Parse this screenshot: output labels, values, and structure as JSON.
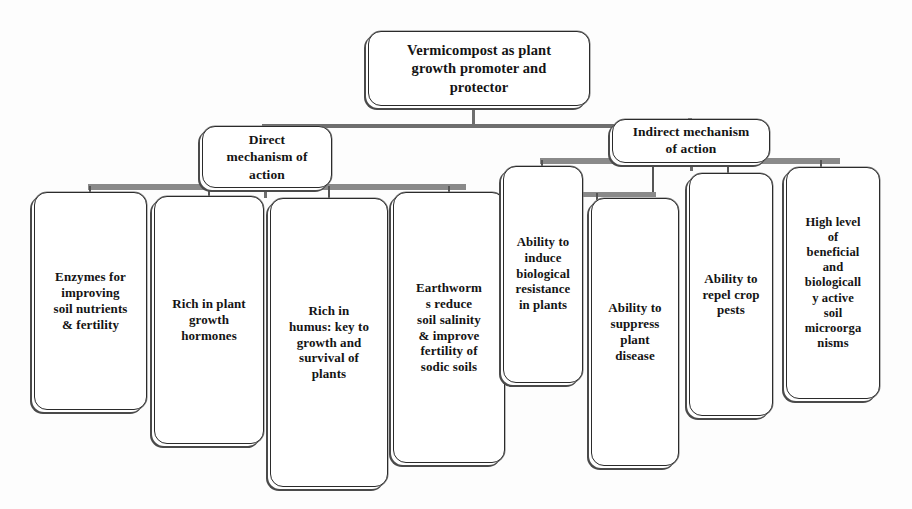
{
  "diagram": {
    "title_node": {
      "id": "root",
      "label": "Vermicompost as plant\ngrowth promoter and\nprotector"
    },
    "branches": [
      {
        "id": "direct",
        "label": "Direct\nmechanism of\naction",
        "leaves": [
          {
            "id": "l1",
            "label": "Enzymes for\nimproving\nsoil nutrients\n& fertility"
          },
          {
            "id": "l2",
            "label": "Rich in plant\ngrowth\nhormones"
          },
          {
            "id": "l3",
            "label": "Rich in\nhumus: key to\ngrowth and\nsurvival of\nplants"
          },
          {
            "id": "l4",
            "label": "Earthworm\ns reduce\nsoil salinity\n& improve\nfertility of\nsodic soils"
          }
        ]
      },
      {
        "id": "indirect",
        "label": "Indirect  mechanism\nof action",
        "leaves": [
          {
            "id": "r1",
            "label": "Ability to\ninduce\nbiological\nresistance\nin plants"
          },
          {
            "id": "r2",
            "label": "Ability to\nsuppress\nplant\ndisease"
          },
          {
            "id": "r3",
            "label": "Ability to\nrepel crop\npests"
          },
          {
            "id": "r4",
            "label": "High level\nof\nbeneficial\nand\nbiologicall\ny active\nsoil\nmicroorga\nnisms"
          }
        ]
      }
    ],
    "colors": {
      "background": "#fdfdfd",
      "box_fill": "#ffffff",
      "box_border": "#2b2b2b",
      "shadow": "#4a4a4a",
      "connector": "#8a8a8a",
      "text": "#141414"
    }
  }
}
